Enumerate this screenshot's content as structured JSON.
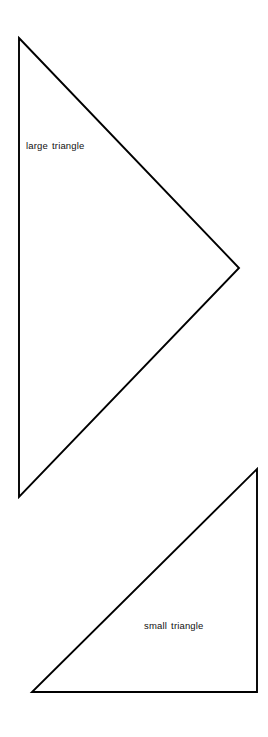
{
  "figure": {
    "background_color": "#ffffff",
    "stroke_color": "#000000",
    "stroke_width": 1.9,
    "width": 268,
    "height": 737,
    "shapes": [
      {
        "id": "large-triangle",
        "label": "large triangle",
        "kind": "triangle",
        "points": "19,38 239,268 19,497",
        "vertices": [
          {
            "x": 19,
            "y": 38
          },
          {
            "x": 239,
            "y": 268
          },
          {
            "x": 19,
            "y": 497
          }
        ],
        "label_position": {
          "x": 26,
          "y": 141
        }
      },
      {
        "id": "small-triangle",
        "label": "small triangle",
        "kind": "triangle",
        "points": "257,469 257,692 32,692",
        "vertices": [
          {
            "x": 257,
            "y": 469
          },
          {
            "x": 257,
            "y": 692
          },
          {
            "x": 32,
            "y": 692
          }
        ],
        "label_position": {
          "x": 144,
          "y": 621
        }
      }
    ]
  }
}
